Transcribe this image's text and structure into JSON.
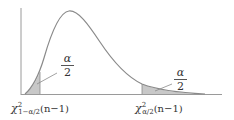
{
  "figure": {
    "left_tail_label": {
      "symbol": "χ",
      "superscript": "2",
      "subscript": "1−α/2",
      "argument": "(n−1)"
    },
    "right_tail_label": {
      "symbol": "χ",
      "superscript": "2",
      "subscript": "α/2",
      "argument": "(n−1)"
    },
    "left_area_label": {
      "numerator": "α",
      "denominator": "2"
    },
    "right_area_label": {
      "numerator": "α",
      "denominator": "2"
    },
    "colors": {
      "curve": "#8a8a8a",
      "axis": "#9a9a9a",
      "shade": "#c8c8c8",
      "text": "#333333"
    }
  }
}
